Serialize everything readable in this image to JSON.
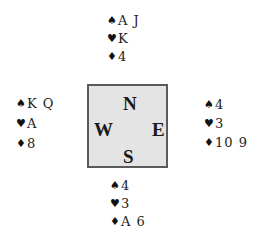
{
  "hands": {
    "north": {
      "spades": "A J",
      "hearts": "K",
      "diamonds": "4"
    },
    "west": {
      "spades": "K Q",
      "hearts": "A",
      "diamonds": "8"
    },
    "east": {
      "spades": "4",
      "hearts": "3",
      "diamonds": "10 9"
    },
    "south": {
      "spades": "4",
      "hearts": "3",
      "diamonds": "A 6"
    }
  },
  "suits": {
    "spades": "♠",
    "hearts": "♥",
    "diamonds": "♦"
  },
  "compass": {
    "north": "N",
    "west": "W",
    "east": "E",
    "south": "S"
  }
}
